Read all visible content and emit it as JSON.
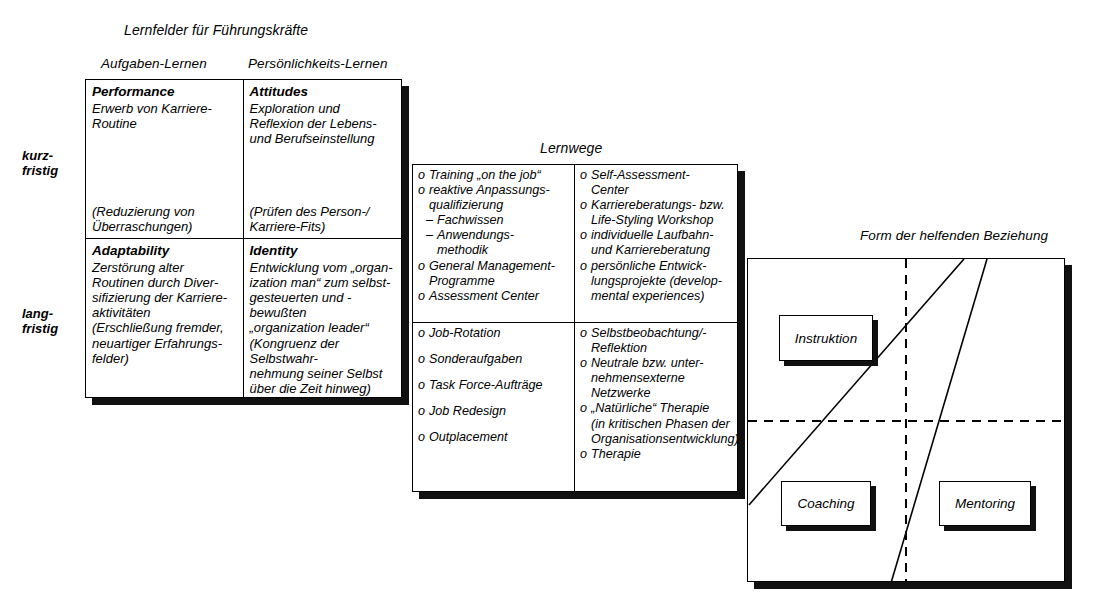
{
  "figure": {
    "panels": [
      "lernfelder",
      "lernwege",
      "form-der-helfenden-beziehung"
    ]
  },
  "lernfelder": {
    "title": "Lernfelder  für Führungskräfte",
    "column_headers": [
      "Aufgaben-Lernen",
      "Persönlichkeits-Lernen"
    ],
    "row_labels": [
      "kurz-\nfristig",
      "lang-\nfristig"
    ],
    "cells": [
      {
        "heading": "Performance",
        "body": "Erwerb von Karriere-\nRoutine",
        "footer": "(Reduzierung von\nÜberraschungen)"
      },
      {
        "heading": "Attitudes",
        "body": "Exploration und\nReflexion der Lebens-\nund Berufseinstellung",
        "footer": "(Prüfen des Person-/\nKarriere-Fits)"
      },
      {
        "heading": "Adaptability",
        "body": "Zerstörung alter\nRoutinen durch Diver-\nsifizierung der Karriere-\naktivitäten\n(Erschließung fremder,\nneuartiger Erfahrungs-\nfelder)",
        "footer": ""
      },
      {
        "heading": "Identity",
        "body": "Entwicklung vom „organ-\nization man“ zum selbst-\ngesteuerten und -bewußten\n„organization leader“\n(Kongruenz der Selbstwahr-\nnehmung seiner  Selbst\nüber die Zeit hinweg)",
        "footer": ""
      }
    ]
  },
  "lernwege": {
    "title": "Lernwege",
    "quadrants": [
      {
        "items": [
          {
            "text": "Training „on the job“",
            "style": "bullet"
          },
          {
            "text": "reaktive Anpassungs-\nqualifizierung",
            "style": "bullet"
          },
          {
            "text": "Fachwissen",
            "style": "dash"
          },
          {
            "text": "Anwendungs-\nmethodik",
            "style": "dash"
          },
          {
            "text": "General Management-\nProgramme",
            "style": "bullet"
          },
          {
            "text": "Assessment Center",
            "style": "bullet"
          }
        ]
      },
      {
        "items": [
          {
            "text": "Self-Assessment-\nCenter",
            "style": "bullet"
          },
          {
            "text": "Karriereberatungs- bzw.\nLife-Styling Workshop",
            "style": "bullet"
          },
          {
            "text": "individuelle Laufbahn-\nund Karriereberatung",
            "style": "bullet"
          },
          {
            "text": "persönliche Entwick-\nlungsprojekte (develop-\nmental experiences)",
            "style": "bullet"
          }
        ]
      },
      {
        "items": [
          {
            "text": "Job-Rotation",
            "style": "bullet"
          },
          {
            "text": "Sonderaufgaben",
            "style": "bullet-spaced"
          },
          {
            "text": "Task Force-Aufträge",
            "style": "bullet-spaced"
          },
          {
            "text": "Job Redesign",
            "style": "bullet-spaced"
          },
          {
            "text": "Outplacement",
            "style": "bullet-spaced"
          }
        ]
      },
      {
        "items": [
          {
            "text": "Selbstbeobachtung/-\nReflektion",
            "style": "bullet"
          },
          {
            "text": "Neutrale bzw. unter-\nnehmensexterne\nNetzwerke",
            "style": "bullet"
          },
          {
            "text": "„Natürliche“ Therapie\n(in kritischen Phasen der\nOrganisationsentwicklung)",
            "style": "bullet"
          },
          {
            "text": "Therapie",
            "style": "bullet"
          }
        ]
      }
    ]
  },
  "beziehung": {
    "title": "Form der helfenden Beziehung",
    "labels": [
      {
        "name": "instruktion",
        "text": "Instruktion"
      },
      {
        "name": "coaching",
        "text": "Coaching"
      },
      {
        "name": "mentoring",
        "text": "Mentoring"
      }
    ],
    "divider_style": "dashed-crosshair",
    "diagonals": 2
  },
  "colors": {
    "ink": "#000000",
    "shadow": "#111111",
    "paper": "#ffffff"
  }
}
